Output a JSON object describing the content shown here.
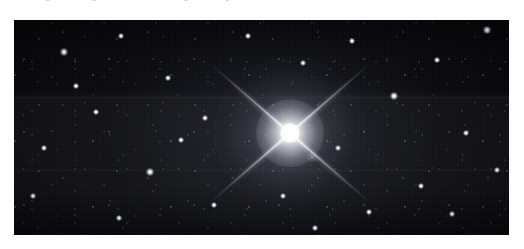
{
  "page": {
    "background_color": "#ffffff",
    "width": 524,
    "height": 249
  },
  "caption": {
    "text": "Fig. 1. — The brightest star in the field, showing diffraction spikes.",
    "color": "#8e8e8e",
    "clipped": "true"
  },
  "photo": {
    "alt_name": "star-field-astrophotograph",
    "background_color": "#06060a",
    "left": 14,
    "top": 20,
    "width": 495,
    "height": 215,
    "description": "Dense monochrome star field with one dominant saturated star near the centre displaying four diagonal diffraction spikes."
  },
  "main_star": {
    "name": "dominant-bright-star",
    "center_x": 276,
    "center_y": 133,
    "spike_count": 4,
    "spike_pattern": "X",
    "spike_angle_deg": 41,
    "core_color": "#ffffff",
    "glow_color": "#e6eaf4"
  },
  "bright_field_stars": [
    {
      "x": 64,
      "y": 52,
      "size": 3.2
    },
    {
      "x": 121,
      "y": 36,
      "size": 2.6
    },
    {
      "x": 168,
      "y": 78,
      "size": 3.0
    },
    {
      "x": 96,
      "y": 112,
      "size": 2.8
    },
    {
      "x": 44,
      "y": 148,
      "size": 2.6
    },
    {
      "x": 150,
      "y": 172,
      "size": 3.1
    },
    {
      "x": 205,
      "y": 118,
      "size": 2.5
    },
    {
      "x": 214,
      "y": 205,
      "size": 2.9
    },
    {
      "x": 303,
      "y": 63,
      "size": 3.0
    },
    {
      "x": 352,
      "y": 41,
      "size": 2.7
    },
    {
      "x": 338,
      "y": 148,
      "size": 2.6
    },
    {
      "x": 394,
      "y": 96,
      "size": 3.3
    },
    {
      "x": 437,
      "y": 60,
      "size": 2.8
    },
    {
      "x": 466,
      "y": 133,
      "size": 3.0
    },
    {
      "x": 421,
      "y": 186,
      "size": 2.7
    },
    {
      "x": 369,
      "y": 212,
      "size": 2.5
    },
    {
      "x": 283,
      "y": 196,
      "size": 2.6
    },
    {
      "x": 487,
      "y": 30,
      "size": 3.4
    },
    {
      "x": 33,
      "y": 196,
      "size": 2.4
    },
    {
      "x": 248,
      "y": 36,
      "size": 2.7
    },
    {
      "x": 181,
      "y": 140,
      "size": 2.4
    },
    {
      "x": 452,
      "y": 214,
      "size": 2.6
    },
    {
      "x": 119,
      "y": 218,
      "size": 2.5
    },
    {
      "x": 76,
      "y": 86,
      "size": 2.4
    },
    {
      "x": 315,
      "y": 228,
      "size": 2.5
    },
    {
      "x": 497,
      "y": 170,
      "size": 2.6
    }
  ]
}
